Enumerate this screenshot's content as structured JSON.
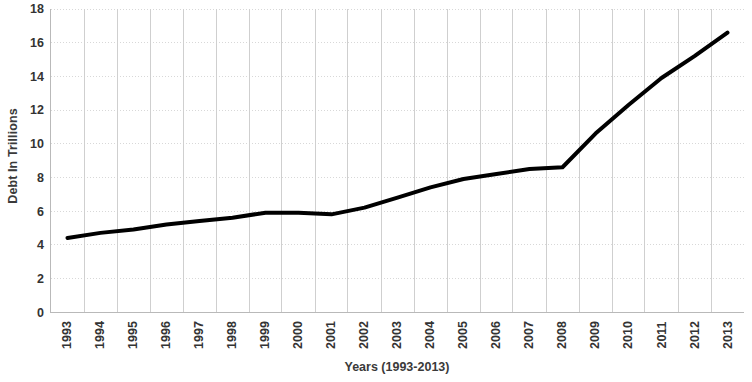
{
  "chart": {
    "type": "line",
    "y_axis_title": "Debt In Trillions",
    "x_axis_title": "Years (1993-2013)"
  },
  "chart_data": {
    "type": "line",
    "title": "",
    "subtitle": "",
    "xlabel": "Years (1993-2013)",
    "ylabel": "Debt In Trillions",
    "categories": [
      "1993",
      "1994",
      "1995",
      "1996",
      "1997",
      "1998",
      "1999",
      "2000",
      "2001",
      "2002",
      "2003",
      "2004",
      "2005",
      "2006",
      "2007",
      "2008",
      "2009",
      "2010",
      "2011",
      "2012",
      "2013"
    ],
    "values": [
      4.4,
      4.7,
      4.9,
      5.2,
      5.4,
      5.6,
      5.9,
      5.9,
      5.8,
      6.2,
      6.8,
      7.4,
      7.9,
      8.2,
      8.5,
      8.6,
      10.6,
      12.3,
      13.9,
      15.2,
      16.6
    ],
    "series": [
      {
        "name": "Debt In Trillions",
        "values": [
          4.4,
          4.7,
          4.9,
          5.2,
          5.4,
          5.6,
          5.9,
          5.9,
          5.8,
          6.2,
          6.8,
          7.4,
          7.9,
          8.2,
          8.5,
          8.6,
          10.6,
          12.3,
          13.9,
          15.2,
          16.6
        ],
        "color": "#000000"
      }
    ],
    "ylim": [
      0,
      18
    ],
    "ytick_labels": [
      "0",
      "2",
      "4",
      "6",
      "8",
      "10",
      "12",
      "14",
      "16",
      "18"
    ],
    "yticks": [
      0,
      2,
      4,
      6,
      8,
      10,
      12,
      14,
      16,
      18
    ],
    "xtick_labels": [
      "1993",
      "1994",
      "1995",
      "1996",
      "1997",
      "1998",
      "1999",
      "2000",
      "2001",
      "2002",
      "2003",
      "2004",
      "2005",
      "2006",
      "2007",
      "2008",
      "2009",
      "2010",
      "2011",
      "2012",
      "2013"
    ],
    "grid": true,
    "grid_style": "dotted",
    "grid_color": "#d8d8d8",
    "legend": false,
    "legend_position": "none",
    "line_color": "#000000",
    "line_width": 4,
    "markers": false,
    "annotations": []
  }
}
